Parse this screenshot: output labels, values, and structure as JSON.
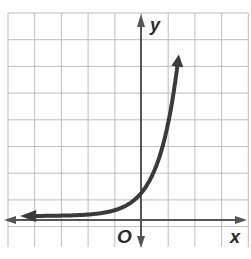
{
  "chart_data": {
    "type": "line",
    "title": "",
    "xlabel": "x",
    "ylabel": "y",
    "origin_label": "O",
    "function": "y = 4^x",
    "x": [
      -5,
      -4,
      -3,
      -2,
      -1,
      0,
      0.5,
      1,
      1.3
    ],
    "y": [
      0.001,
      0.004,
      0.016,
      0.0625,
      0.25,
      1,
      2,
      4,
      6.1
    ],
    "xlim": [
      -5,
      4
    ],
    "ylim": [
      -1,
      7
    ],
    "grid": true,
    "grid_unit": 1,
    "asymptote": "y = 0",
    "y_intercept": [
      0,
      1
    ],
    "colors": {
      "curve": "#3a3a3a",
      "axes": "#555555",
      "grid": "#b8b8b8"
    }
  },
  "labels": {
    "x_axis": "x",
    "y_axis": "y",
    "origin": "O"
  }
}
